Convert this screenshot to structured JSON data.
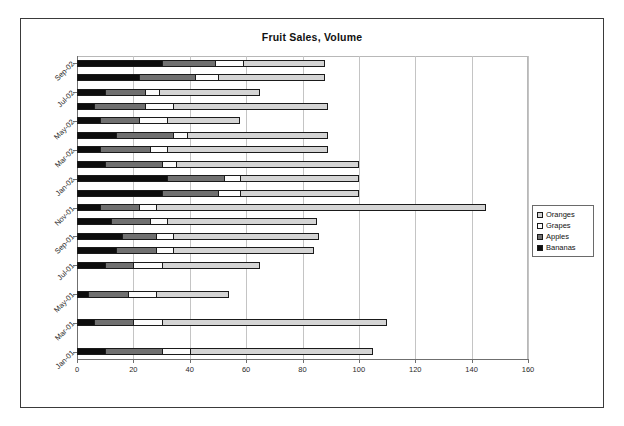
{
  "chart_data": {
    "type": "bar",
    "orientation": "horizontal",
    "stacked": true,
    "title": "Fruit Sales, Volume",
    "xlabel": "",
    "ylabel": "",
    "xlim": [
      0,
      160
    ],
    "xticks": [
      0,
      20,
      40,
      60,
      80,
      100,
      120,
      140,
      160
    ],
    "grid": true,
    "legend_position": "right",
    "categories": [
      "Jan-01",
      "Feb-01",
      "Mar-01",
      "Apr-01",
      "May-01",
      "Jun-01",
      "Jul-01",
      "Aug-01",
      "Sep-01",
      "Oct-01",
      "Nov-01",
      "Dec-01",
      "Jan-02",
      "Feb-02",
      "Mar-02",
      "Apr-02",
      "May-02",
      "Jun-02",
      "Jul-02",
      "Aug-02",
      "Sep-02"
    ],
    "ytick_labels": [
      "Jan-01",
      "Mar-01",
      "May-01",
      "Jul-01",
      "Sep-01",
      "Nov-01",
      "Jan-02",
      "Mar-02",
      "May-02",
      "Jul-02",
      "Sep-02"
    ],
    "series": [
      {
        "name": "Bananas",
        "color": "#0d0d0d",
        "values": [
          10,
          0,
          6,
          0,
          4,
          0,
          10,
          14,
          16,
          12,
          8,
          30,
          32,
          10,
          8,
          14,
          8,
          6,
          10,
          22,
          30
        ]
      },
      {
        "name": "Apples",
        "color": "#707070",
        "values": [
          20,
          0,
          14,
          0,
          14,
          0,
          10,
          14,
          12,
          14,
          14,
          20,
          20,
          20,
          18,
          20,
          14,
          18,
          14,
          20,
          19
        ]
      },
      {
        "name": "Grapes",
        "color": "#fbfbfb",
        "values": [
          10,
          0,
          10,
          0,
          10,
          0,
          10,
          6,
          6,
          6,
          6,
          8,
          6,
          5,
          6,
          5,
          10,
          10,
          5,
          8,
          10
        ]
      },
      {
        "name": "Oranges",
        "color": "#d4d4d4",
        "values": [
          65,
          0,
          80,
          0,
          26,
          0,
          35,
          50,
          52,
          53,
          117,
          42,
          42,
          65,
          57,
          50,
          26,
          55,
          36,
          38,
          29
        ]
      }
    ],
    "totals": [
      105,
      0,
      110,
      0,
      54,
      0,
      65,
      84,
      86,
      85,
      145,
      100,
      100,
      100,
      89,
      89,
      58,
      89,
      65,
      88,
      88
    ]
  },
  "legend": {
    "items": [
      {
        "label": "Oranges",
        "key_color": "#d4d4d4"
      },
      {
        "label": "Grapes",
        "key_color": "#fbfbfb"
      },
      {
        "label": "Apples",
        "key_color": "#707070"
      },
      {
        "label": "Bananas",
        "key_color": "#0d0d0d"
      }
    ]
  }
}
